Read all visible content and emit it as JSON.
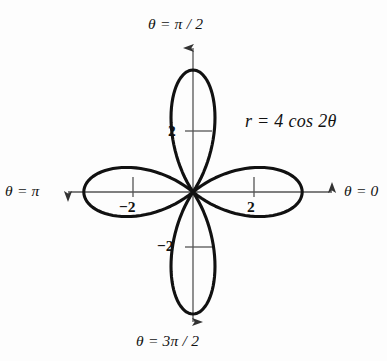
{
  "figure": {
    "background_color": "#fdfdfd",
    "curve_color": "#111111",
    "axis_color": "#555555",
    "equation_label": "r = 4 cos 2θ",
    "equation_parts": {
      "variable": "r",
      "equals": "=",
      "coefficient": "4",
      "function": "cos",
      "multiplier": "2",
      "angle_symbol": "θ"
    }
  },
  "axes": {
    "origin": {
      "x": 193,
      "y": 192
    },
    "endpoint_labels": [
      {
        "name": "theta-zero",
        "text": "θ = 0",
        "direction": "right"
      },
      {
        "name": "theta-half-pi",
        "text": "θ = π / 2",
        "direction": "up"
      },
      {
        "name": "theta-pi",
        "text": "θ = π",
        "direction": "left"
      },
      {
        "name": "theta-3half-pi",
        "text": "θ = 3π / 2",
        "direction": "down"
      }
    ],
    "ticks": [
      {
        "name": "tick-x-positive",
        "text": "2",
        "axis": "horizontal",
        "value": 2
      },
      {
        "name": "tick-x-negative",
        "text": "−2",
        "axis": "horizontal",
        "value": -2
      },
      {
        "name": "tick-y-positive",
        "text": "2",
        "axis": "vertical",
        "value": 2
      },
      {
        "name": "tick-y-negative",
        "text": "−2",
        "axis": "vertical",
        "value": -2
      }
    ]
  },
  "chart_data": {
    "type": "line",
    "subtype": "polar-rose",
    "title": "r = 4 cos 2θ",
    "equation": "r = 4*cos(2*theta)",
    "coordinate_system": "polar",
    "xlabel": "θ = 0",
    "ylabel": "θ = π / 2",
    "grid": false,
    "legend": false,
    "amplitude": 4,
    "petal_count": 4,
    "petal_angles_deg": [
      0,
      90,
      180,
      270
    ],
    "r_max": 4,
    "theta_range_deg": [
      0,
      360
    ],
    "xlim": [
      -4.8,
      4.8
    ],
    "ylim": [
      -4.8,
      4.8
    ],
    "xticks": [
      -2,
      2
    ],
    "yticks": [
      -2,
      2
    ],
    "xtick_labels": [
      "−2",
      "2"
    ],
    "ytick_labels": [
      "−2",
      "2"
    ],
    "series": [
      {
        "name": "r = 4 cos 2θ",
        "theta_deg": [
          0,
          10,
          20,
          30,
          40,
          45,
          50,
          60,
          70,
          80,
          90,
          100,
          110,
          120,
          130,
          135,
          140,
          150,
          160,
          170,
          180,
          190,
          200,
          210,
          220,
          225,
          230,
          240,
          250,
          260,
          270,
          280,
          290,
          300,
          310,
          315,
          320,
          330,
          340,
          350,
          360
        ],
        "r": [
          4,
          3.76,
          3.06,
          2,
          0.69,
          0,
          -0.69,
          -2,
          -3.06,
          -3.76,
          -4,
          -3.76,
          -3.06,
          -2,
          -0.69,
          0,
          0.69,
          2,
          3.06,
          3.76,
          4,
          3.76,
          3.06,
          2,
          0.69,
          0,
          -0.69,
          -2,
          -3.06,
          -3.76,
          -4,
          -3.76,
          -3.06,
          -2,
          -0.69,
          0,
          0.69,
          2,
          3.06,
          3.76,
          4
        ]
      }
    ],
    "petal_tips": [
      {
        "theta_deg": 0,
        "r": 4
      },
      {
        "theta_deg": 90,
        "r": 4
      },
      {
        "theta_deg": 180,
        "r": 4
      },
      {
        "theta_deg": 270,
        "r": 4
      }
    ],
    "annotations": [
      {
        "text": "r = 4 cos 2θ",
        "theta_deg": 45,
        "note": "equation label, upper-right quadrant"
      }
    ]
  }
}
